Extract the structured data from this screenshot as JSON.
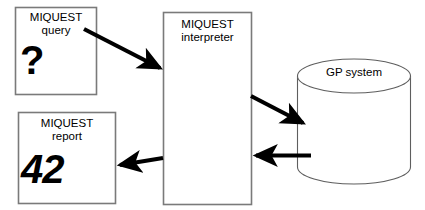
{
  "diagram": {
    "background_color": "#ffffff",
    "stroke_color": "#000000",
    "box_border_color": "#808080",
    "cylinder_border_color": "#595959",
    "arrow_color": "#000000",
    "nodes": [
      {
        "id": "miquest-query",
        "shape": "rectangle",
        "line1": "MIQUEST",
        "line2": "query",
        "glyph": "?"
      },
      {
        "id": "miquest-interpreter",
        "shape": "rectangle",
        "line1": "MIQUEST",
        "line2": "interpreter",
        "glyph": ""
      },
      {
        "id": "gp-system",
        "shape": "cylinder",
        "line1": "GP system",
        "line2": "",
        "glyph": ""
      },
      {
        "id": "miquest-report",
        "shape": "rectangle",
        "line1": "MIQUEST",
        "line2": "report",
        "glyph": "42"
      }
    ],
    "edges": [
      {
        "id": "query-to-interpreter",
        "from": "miquest-query",
        "to": "miquest-interpreter",
        "label": ""
      },
      {
        "id": "interpreter-to-gp",
        "from": "miquest-interpreter",
        "to": "gp-system",
        "label": ""
      },
      {
        "id": "gp-to-interpreter",
        "from": "gp-system",
        "to": "miquest-interpreter",
        "label": ""
      },
      {
        "id": "interpreter-to-report",
        "from": "miquest-interpreter",
        "to": "miquest-report",
        "label": ""
      }
    ]
  }
}
